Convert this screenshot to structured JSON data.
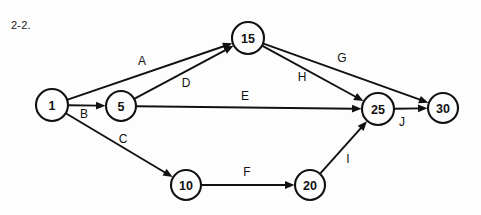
{
  "figure": {
    "label": "2-2.",
    "background_color": "#fdfdfd",
    "ink_color": "#111111"
  },
  "chart_data": {
    "type": "diagram",
    "diagram_kind": "activity-on-arrow network diagram",
    "title": "2-2.",
    "directed": true,
    "nodes": [
      {
        "id": "n1",
        "label": "1",
        "x": 52,
        "y": 105,
        "r": 16
      },
      {
        "id": "n5",
        "label": "5",
        "x": 121,
        "y": 106,
        "r": 15
      },
      {
        "id": "n15",
        "label": "15",
        "x": 248,
        "y": 38,
        "r": 16
      },
      {
        "id": "n10",
        "label": "10",
        "x": 186,
        "y": 185,
        "r": 15
      },
      {
        "id": "n20",
        "label": "20",
        "x": 310,
        "y": 185,
        "r": 15
      },
      {
        "id": "n25",
        "label": "25",
        "x": 378,
        "y": 109,
        "r": 16
      },
      {
        "id": "n30",
        "label": "30",
        "x": 443,
        "y": 108,
        "r": 15
      }
    ],
    "edges": [
      {
        "id": "A",
        "label": "A",
        "from": "n1",
        "to": "n15",
        "label_x": 142,
        "label_y": 61
      },
      {
        "id": "B",
        "label": "B",
        "from": "n1",
        "to": "n5",
        "label_x": 84,
        "label_y": 114
      },
      {
        "id": "C",
        "label": "C",
        "from": "n1",
        "to": "n10",
        "label_x": 123,
        "label_y": 139
      },
      {
        "id": "D",
        "label": "D",
        "from": "n5",
        "to": "n15",
        "label_x": 186,
        "label_y": 83
      },
      {
        "id": "E",
        "label": "E",
        "from": "n5",
        "to": "n25",
        "label_x": 245,
        "label_y": 96
      },
      {
        "id": "F",
        "label": "F",
        "from": "n10",
        "to": "n20",
        "label_x": 247,
        "label_y": 172
      },
      {
        "id": "G",
        "label": "G",
        "from": "n15",
        "to": "n30",
        "label_x": 342,
        "label_y": 58
      },
      {
        "id": "H",
        "label": "H",
        "from": "n15",
        "to": "n25",
        "label_x": 302,
        "label_y": 77
      },
      {
        "id": "I",
        "label": "I",
        "from": "n20",
        "to": "n25",
        "label_x": 348,
        "label_y": 159
      },
      {
        "id": "J",
        "label": "J",
        "from": "n25",
        "to": "n30",
        "label_x": 402,
        "label_y": 122
      }
    ]
  }
}
